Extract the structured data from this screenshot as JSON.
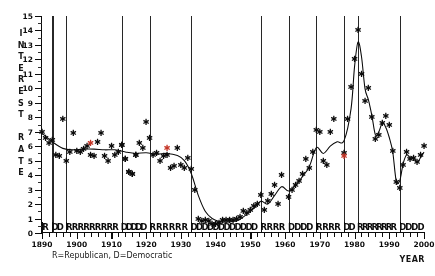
{
  "chart_data": {
    "type": "scatter",
    "title": "",
    "xlabel": "YEAR",
    "ylabel": "INTEREST RATE",
    "xlim": [
      1890,
      2000
    ],
    "ylim": [
      0,
      15
    ],
    "grid": false,
    "legend": "R=Republican, D=Democratic",
    "legend_position": "below-axis",
    "y_ticks": [
      0,
      1,
      2,
      3,
      4,
      5,
      6,
      7,
      8,
      9,
      10,
      11,
      12,
      13,
      14,
      15
    ],
    "x_ticks": [
      1890,
      1900,
      1910,
      1920,
      1930,
      1940,
      1950,
      1960,
      1970,
      1980,
      1990,
      2000
    ],
    "y_axis_letters": [
      "I",
      "N",
      "T",
      "E",
      "R",
      "E",
      "S",
      "T",
      "",
      "R",
      "A",
      "T",
      "E"
    ],
    "series": [
      {
        "name": "Interest rate observations (Republican years)",
        "marker": "asterisk",
        "color": "#111111",
        "points": [
          [
            1890,
            7.0
          ],
          [
            1891,
            6.6
          ],
          [
            1892,
            6.2
          ],
          [
            1893,
            6.4
          ],
          [
            1894,
            5.4
          ],
          [
            1895,
            5.3
          ],
          [
            1896,
            7.9
          ],
          [
            1897,
            5.0
          ],
          [
            1898,
            5.6
          ],
          [
            1899,
            6.9
          ],
          [
            1900,
            5.7
          ],
          [
            1901,
            5.6
          ],
          [
            1902,
            5.8
          ],
          [
            1903,
            6.0
          ],
          [
            1904,
            5.4
          ],
          [
            1905,
            5.3
          ],
          [
            1906,
            6.3
          ],
          [
            1907,
            6.9
          ],
          [
            1908,
            5.3
          ],
          [
            1909,
            5.0
          ],
          [
            1910,
            6.0
          ],
          [
            1911,
            5.4
          ],
          [
            1912,
            5.6
          ],
          [
            1913,
            6.1
          ],
          [
            1914,
            5.1
          ],
          [
            1915,
            4.2
          ],
          [
            1916,
            4.1
          ],
          [
            1917,
            5.4
          ],
          [
            1918,
            6.2
          ],
          [
            1919,
            5.9
          ],
          [
            1920,
            7.7
          ],
          [
            1921,
            6.6
          ],
          [
            1922,
            5.4
          ],
          [
            1923,
            5.5
          ],
          [
            1924,
            5.0
          ],
          [
            1925,
            5.3
          ],
          [
            1926,
            5.4
          ],
          [
            1927,
            4.5
          ],
          [
            1928,
            4.6
          ],
          [
            1929,
            5.9
          ],
          [
            1930,
            4.7
          ],
          [
            1931,
            4.5
          ],
          [
            1932,
            5.2
          ],
          [
            1933,
            4.4
          ],
          [
            1934,
            3.0
          ],
          [
            1953,
            2.6
          ],
          [
            1954,
            1.6
          ],
          [
            1955,
            2.2
          ],
          [
            1956,
            2.7
          ],
          [
            1957,
            3.3
          ],
          [
            1970,
            7.0
          ],
          [
            1971,
            5.0
          ],
          [
            1972,
            4.7
          ],
          [
            1973,
            7.0
          ],
          [
            1974,
            7.9
          ],
          [
            1981,
            14.0
          ],
          [
            1982,
            11.0
          ],
          [
            1983,
            9.1
          ],
          [
            1984,
            10.0
          ],
          [
            1985,
            8.0
          ],
          [
            1986,
            6.5
          ],
          [
            1987,
            6.8
          ],
          [
            1988,
            7.6
          ],
          [
            1989,
            8.1
          ],
          [
            1990,
            7.5
          ],
          [
            1991,
            5.7
          ],
          [
            1992,
            3.5
          ]
        ]
      },
      {
        "name": "Interest rate observations (Democratic years)",
        "marker": "asterisk",
        "color": "#111111",
        "points": [
          [
            1913,
            6.1
          ],
          [
            1914,
            5.1
          ],
          [
            1915,
            4.2
          ],
          [
            1916,
            4.1
          ],
          [
            1917,
            5.4
          ],
          [
            1935,
            1.0
          ],
          [
            1936,
            0.8
          ],
          [
            1937,
            0.9
          ],
          [
            1938,
            0.8
          ],
          [
            1939,
            0.6
          ],
          [
            1940,
            0.6
          ],
          [
            1941,
            0.7
          ],
          [
            1942,
            0.9
          ],
          [
            1943,
            0.9
          ],
          [
            1944,
            0.9
          ],
          [
            1945,
            0.9
          ],
          [
            1946,
            1.0
          ],
          [
            1947,
            1.1
          ],
          [
            1948,
            1.5
          ],
          [
            1949,
            1.4
          ],
          [
            1950,
            1.6
          ],
          [
            1951,
            1.9
          ],
          [
            1952,
            2.0
          ],
          [
            1958,
            2.0
          ],
          [
            1959,
            4.0
          ],
          [
            1961,
            2.5
          ],
          [
            1962,
            3.0
          ],
          [
            1963,
            3.3
          ],
          [
            1964,
            3.6
          ],
          [
            1965,
            4.1
          ],
          [
            1966,
            5.1
          ],
          [
            1967,
            4.5
          ],
          [
            1968,
            5.6
          ],
          [
            1969,
            7.1
          ],
          [
            1977,
            5.5
          ],
          [
            1978,
            7.9
          ],
          [
            1979,
            10.1
          ],
          [
            1980,
            12.0
          ],
          [
            1993,
            3.1
          ],
          [
            1994,
            4.7
          ],
          [
            1995,
            5.6
          ],
          [
            1996,
            5.1
          ],
          [
            1997,
            5.2
          ],
          [
            1998,
            4.9
          ],
          [
            1999,
            5.4
          ],
          [
            2000,
            6.0
          ]
        ]
      },
      {
        "name": "Highlighted observations",
        "marker": "asterisk",
        "color": "#c0392b",
        "points": [
          [
            1904,
            6.2
          ],
          [
            1926,
            5.9
          ],
          [
            1977,
            5.3
          ]
        ]
      },
      {
        "name": "Smoothed trend",
        "marker": "line",
        "color": "#111111",
        "points": [
          [
            1890,
            6.9
          ],
          [
            1893,
            6.3
          ],
          [
            1896,
            5.85
          ],
          [
            1899,
            5.75
          ],
          [
            1902,
            5.8
          ],
          [
            1905,
            5.8
          ],
          [
            1908,
            5.75
          ],
          [
            1911,
            5.75
          ],
          [
            1914,
            5.6
          ],
          [
            1917,
            5.5
          ],
          [
            1920,
            5.55
          ],
          [
            1923,
            5.45
          ],
          [
            1926,
            5.5
          ],
          [
            1929,
            5.35
          ],
          [
            1931,
            5.0
          ],
          [
            1933,
            4.1
          ],
          [
            1935,
            2.6
          ],
          [
            1937,
            1.5
          ],
          [
            1939,
            1.0
          ],
          [
            1941,
            0.8
          ],
          [
            1943,
            0.75
          ],
          [
            1945,
            0.8
          ],
          [
            1947,
            0.95
          ],
          [
            1949,
            1.3
          ],
          [
            1951,
            1.7
          ],
          [
            1953,
            2.2
          ],
          [
            1955,
            2.0
          ],
          [
            1957,
            2.6
          ],
          [
            1959,
            3.2
          ],
          [
            1961,
            2.9
          ],
          [
            1963,
            3.3
          ],
          [
            1965,
            3.9
          ],
          [
            1967,
            4.6
          ],
          [
            1969,
            5.9
          ],
          [
            1971,
            5.5
          ],
          [
            1973,
            6.0
          ],
          [
            1975,
            6.3
          ],
          [
            1977,
            6.4
          ],
          [
            1979,
            8.6
          ],
          [
            1980,
            11.5
          ],
          [
            1981,
            13.2
          ],
          [
            1982,
            12.2
          ],
          [
            1983,
            10.0
          ],
          [
            1984,
            9.2
          ],
          [
            1985,
            8.1
          ],
          [
            1986,
            6.8
          ],
          [
            1987,
            7.0
          ],
          [
            1988,
            7.6
          ],
          [
            1989,
            7.3
          ],
          [
            1990,
            6.6
          ],
          [
            1991,
            5.6
          ],
          [
            1992,
            3.6
          ],
          [
            1993,
            3.6
          ],
          [
            1994,
            4.8
          ],
          [
            1995,
            5.4
          ],
          [
            1996,
            5.2
          ],
          [
            1997,
            5.2
          ],
          [
            1998,
            4.9
          ],
          [
            1999,
            5.2
          ],
          [
            2000,
            5.6
          ]
        ]
      }
    ],
    "party_sequence": [
      {
        "start": 1890,
        "end": 1892,
        "party": "R",
        "letters": "R"
      },
      {
        "start": 1893,
        "end": 1896,
        "party": "D",
        "letters": "DD"
      },
      {
        "start": 1897,
        "end": 1912,
        "party": "R",
        "letters": "RRRRRRRRR"
      },
      {
        "start": 1913,
        "end": 1920,
        "party": "D",
        "letters": "DDDDD"
      },
      {
        "start": 1921,
        "end": 1932,
        "party": "R",
        "letters": "RRRRRR"
      },
      {
        "start": 1933,
        "end": 1952,
        "party": "D",
        "letters": "DDDDDDDDDDDD"
      },
      {
        "start": 1953,
        "end": 1960,
        "party": "R",
        "letters": "RRRR"
      },
      {
        "start": 1961,
        "end": 1968,
        "party": "D",
        "letters": "DDDD"
      },
      {
        "start": 1969,
        "end": 1976,
        "party": "R",
        "letters": "RRRR"
      },
      {
        "start": 1977,
        "end": 1980,
        "party": "D",
        "letters": "DD"
      },
      {
        "start": 1981,
        "end": 1992,
        "party": "R",
        "letters": "RRRRRRRR"
      },
      {
        "start": 1993,
        "end": 2000,
        "party": "D",
        "letters": "DDDD"
      }
    ],
    "party_change_years": [
      1893,
      1897,
      1913,
      1921,
      1933,
      1953,
      1961,
      1969,
      1977,
      1981,
      1993
    ]
  },
  "colors": {
    "axis": "#111111",
    "marker": "#111111",
    "marker_highlight": "#c0392b",
    "vline": "#2b2b2b",
    "background": "#ffffff"
  }
}
